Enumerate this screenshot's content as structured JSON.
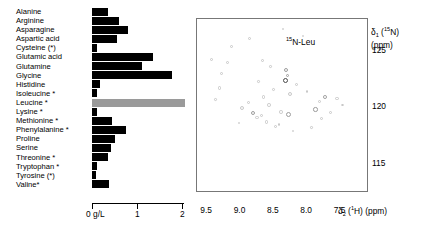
{
  "figure": {
    "panels": [
      "amino-acid-concentration-bar-chart",
      "hsqc-nmr-spectrum"
    ]
  },
  "chart_data": [
    {
      "type": "bar",
      "orientation": "horizontal",
      "title": "",
      "xlabel": "0 g/L",
      "ylabel": "",
      "xlim": [
        0,
        2.3
      ],
      "grid": false,
      "legend": null,
      "axis_ticks": [
        "0 g/L",
        "1",
        "2"
      ],
      "axis_tick_values": [
        0,
        1,
        2
      ],
      "highlight_color": "#9a9a9a",
      "bar_color": "#000000",
      "highlighted_category": "Leucine *",
      "categories": [
        "Alanine",
        "Arginine",
        "Asparagine",
        "Aspartic acid",
        "Cysteine (*)",
        "Glutamic acid",
        "Glutamine",
        "Glycine",
        "Histidine",
        "Isoleucine *",
        "Leucine *",
        "Lysine *",
        "Methionine *",
        "Phenylalanine *",
        "Proline",
        "Serine",
        "Threonine *",
        "Tryptophan *",
        "Tyrosine (*)",
        "Valine*"
      ],
      "values": [
        0.35,
        0.6,
        0.8,
        0.55,
        0.1,
        1.35,
        1.1,
        1.75,
        0.18,
        0.1,
        0.6,
        0.1,
        0.45,
        0.75,
        0.5,
        0.42,
        0.35,
        0.12,
        0.08,
        0.38
      ],
      "highlight_values": [
        null,
        null,
        null,
        null,
        null,
        null,
        null,
        null,
        null,
        null,
        2.05,
        null,
        null,
        null,
        null,
        null,
        null,
        null,
        null,
        null
      ]
    },
    {
      "type": "scatter",
      "title": "",
      "annotation": "15N-Leu",
      "annotation_parts": {
        "pre": "",
        "sup": "15",
        "post": "N-Leu"
      },
      "xlabel": "d2 (1H) (ppm)",
      "xlabel_parts": {
        "delta": "δ",
        "sub": "2",
        "mid": " (",
        "sup": "1",
        "post": "H) (ppm)"
      },
      "ylabel": "d1 (15N) (ppm)",
      "ylabel_parts": {
        "delta": "δ",
        "sub": "1",
        "mid": " (",
        "sup": "15",
        "post": "N)"
      },
      "ylabel_units": "(ppm)",
      "xlim": [
        9.7,
        7.15
      ],
      "ylim": [
        127.8,
        112.6
      ],
      "x_inverted": true,
      "y_inverted": true,
      "grid": false,
      "xticks": [
        "9.5",
        "9.0",
        "8.5",
        "8.0",
        "7.5"
      ],
      "xtick_values": [
        9.5,
        9.0,
        8.5,
        8.0,
        7.5
      ],
      "yticks": [
        "115",
        "120",
        "125"
      ],
      "ytick_values": [
        115,
        120,
        125
      ],
      "point_count": 41,
      "points": [
        {
          "x": 9.02,
          "y": 119.9,
          "size": 4.0,
          "style": "faint"
        },
        {
          "x": 8.93,
          "y": 120.4,
          "size": 3.4,
          "style": "faint"
        },
        {
          "x": 8.86,
          "y": 119.5,
          "size": 4.6,
          "style": "normal"
        },
        {
          "x": 8.8,
          "y": 119.1,
          "size": 3.2,
          "style": "faint"
        },
        {
          "x": 8.74,
          "y": 119.3,
          "size": 3.0,
          "style": "faint"
        },
        {
          "x": 8.7,
          "y": 120.9,
          "size": 3.4,
          "style": "faint"
        },
        {
          "x": 8.62,
          "y": 120.2,
          "size": 3.6,
          "style": "faint"
        },
        {
          "x": 8.55,
          "y": 121.6,
          "size": 2.8,
          "style": "faint"
        },
        {
          "x": 8.44,
          "y": 119.6,
          "size": 3.6,
          "style": "faint"
        },
        {
          "x": 8.33,
          "y": 119.4,
          "size": 5.0,
          "style": "normal"
        },
        {
          "x": 8.3,
          "y": 121.2,
          "size": 4.0,
          "style": "faint"
        },
        {
          "x": 8.38,
          "y": 122.4,
          "size": 5.0,
          "style": "strong"
        },
        {
          "x": 8.37,
          "y": 123.3,
          "size": 4.2,
          "style": "normal"
        },
        {
          "x": 8.21,
          "y": 122.0,
          "size": 3.2,
          "style": "faint"
        },
        {
          "x": 7.92,
          "y": 119.8,
          "size": 4.4,
          "style": "normal"
        },
        {
          "x": 7.86,
          "y": 120.5,
          "size": 3.6,
          "style": "faint"
        },
        {
          "x": 7.84,
          "y": 119.0,
          "size": 3.0,
          "style": "faint"
        },
        {
          "x": 7.78,
          "y": 120.9,
          "size": 3.8,
          "style": "normal"
        },
        {
          "x": 7.6,
          "y": 120.8,
          "size": 3.4,
          "style": "faint"
        },
        {
          "x": 9.36,
          "y": 121.7,
          "size": 3.2,
          "style": "faint"
        },
        {
          "x": 9.33,
          "y": 123.0,
          "size": 3.4,
          "style": "faint"
        },
        {
          "x": 9.24,
          "y": 124.0,
          "size": 3.0,
          "style": "faint"
        },
        {
          "x": 9.48,
          "y": 124.2,
          "size": 3.2,
          "style": "faint"
        },
        {
          "x": 9.18,
          "y": 125.4,
          "size": 3.0,
          "style": "faint"
        },
        {
          "x": 8.72,
          "y": 124.1,
          "size": 3.2,
          "style": "faint"
        },
        {
          "x": 8.34,
          "y": 122.8,
          "size": 3.6,
          "style": "normal"
        },
        {
          "x": 8.47,
          "y": 118.5,
          "size": 2.8,
          "style": "faint"
        },
        {
          "x": 8.52,
          "y": 118.3,
          "size": 3.0,
          "style": "faint"
        },
        {
          "x": 8.66,
          "y": 118.7,
          "size": 3.2,
          "style": "faint"
        },
        {
          "x": 8.11,
          "y": 126.3,
          "size": 2.8,
          "style": "faint"
        },
        {
          "x": 8.92,
          "y": 126.1,
          "size": 3.0,
          "style": "faint"
        },
        {
          "x": 8.41,
          "y": 126.9,
          "size": 2.6,
          "style": "faint"
        },
        {
          "x": 9.07,
          "y": 118.6,
          "size": 2.6,
          "style": "faint"
        },
        {
          "x": 8.26,
          "y": 117.9,
          "size": 2.6,
          "style": "faint"
        },
        {
          "x": 7.98,
          "y": 118.2,
          "size": 2.6,
          "style": "faint"
        },
        {
          "x": 7.7,
          "y": 119.5,
          "size": 3.0,
          "style": "faint"
        },
        {
          "x": 7.52,
          "y": 120.2,
          "size": 2.8,
          "style": "faint"
        },
        {
          "x": 8.05,
          "y": 121.4,
          "size": 2.6,
          "style": "faint"
        },
        {
          "x": 8.78,
          "y": 122.3,
          "size": 2.6,
          "style": "faint"
        },
        {
          "x": 8.6,
          "y": 123.6,
          "size": 2.6,
          "style": "faint"
        },
        {
          "x": 9.42,
          "y": 120.7,
          "size": 2.6,
          "style": "faint"
        }
      ]
    }
  ]
}
